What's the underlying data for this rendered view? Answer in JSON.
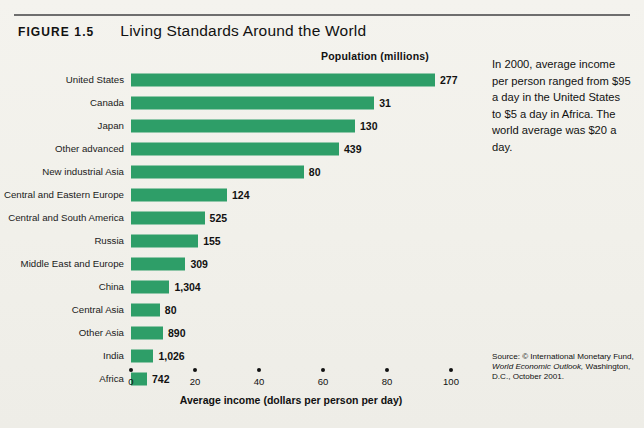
{
  "figure": {
    "label": "FIGURE 1.5",
    "title": "Living Standards Around the World"
  },
  "side_note": "In 2000, average income per person ranged from $95 a day in the United States to $5 a day in Africa. The world average was $20 a day.",
  "source": {
    "prefix": "Source: © International Monetary Fund, ",
    "italic": "World Economic Outlook,",
    "suffix": " Washington, D.C., October 2001."
  },
  "chart_data": {
    "type": "bar",
    "orientation": "horizontal",
    "title": "Living Standards Around the World",
    "xlabel": "Average income (dollars per person per day)",
    "ylabel": "",
    "xlim": [
      0,
      100
    ],
    "xticks": [
      0,
      20,
      40,
      60,
      80,
      100
    ],
    "grid": false,
    "legend": false,
    "bar_color": "#2e9e68",
    "value_column_header": "Population (millions)",
    "categories": [
      "United States",
      "Canada",
      "Japan",
      "Other advanced",
      "New industrial Asia",
      "Central and Eastern Europe",
      "Central and South America",
      "Russia",
      "Middle East and Europe",
      "China",
      "Central Asia",
      "Other Asia",
      "India",
      "Africa"
    ],
    "values": [
      95,
      76,
      70,
      65,
      54,
      30,
      23,
      21,
      17,
      12,
      9,
      10,
      7,
      5
    ],
    "population_labels": [
      "277",
      "31",
      "130",
      "439",
      "80",
      "124",
      "525",
      "155",
      "309",
      "1,304",
      "80",
      "890",
      "1,026",
      "742"
    ],
    "population_values": [
      277,
      31,
      130,
      439,
      80,
      124,
      525,
      155,
      309,
      1304,
      80,
      890,
      1026,
      742
    ]
  }
}
